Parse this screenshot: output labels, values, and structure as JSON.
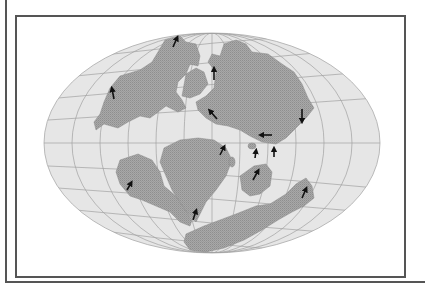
{
  "map": {
    "projection": "mollweide-like elliptical",
    "colors": {
      "ocean": "#e6e6e6",
      "land": "#a3a3a3",
      "graticule": "#9a9a9a",
      "frame": "#555555",
      "arrow": "#111111"
    },
    "arrows_description": "Paleomagnetic plate motion vectors",
    "arrows": [
      {
        "x1": 173,
        "y1": 47,
        "x2": 177,
        "y2": 38
      },
      {
        "x1": 114,
        "y1": 99,
        "x2": 112,
        "y2": 89
      },
      {
        "x1": 214,
        "y1": 80,
        "x2": 214,
        "y2": 69
      },
      {
        "x1": 302,
        "y1": 109,
        "x2": 302,
        "y2": 121
      },
      {
        "x1": 217,
        "y1": 119,
        "x2": 210,
        "y2": 111
      },
      {
        "x1": 272,
        "y1": 135,
        "x2": 261,
        "y2": 135
      },
      {
        "x1": 220,
        "y1": 155,
        "x2": 224,
        "y2": 147
      },
      {
        "x1": 255,
        "y1": 158,
        "x2": 256,
        "y2": 151
      },
      {
        "x1": 274,
        "y1": 157,
        "x2": 274,
        "y2": 149
      },
      {
        "x1": 253,
        "y1": 180,
        "x2": 258,
        "y2": 171
      },
      {
        "x1": 127,
        "y1": 190,
        "x2": 131,
        "y2": 183
      },
      {
        "x1": 193,
        "y1": 220,
        "x2": 196,
        "y2": 211
      },
      {
        "x1": 302,
        "y1": 198,
        "x2": 306,
        "y2": 189
      }
    ]
  }
}
